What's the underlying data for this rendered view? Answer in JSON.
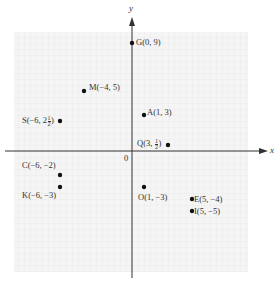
{
  "diagram": {
    "type": "coordinate-plane",
    "axes": {
      "x_label": "x",
      "y_label": "y",
      "origin_label": "0"
    },
    "grid": {
      "on": true,
      "x_range": [
        -10,
        10
      ],
      "y_range": [
        -10,
        10
      ],
      "unit_px": 12
    },
    "points": [
      {
        "id": "G",
        "x": 0,
        "y": 9,
        "label": "G(0, 9)",
        "label_side": "right"
      },
      {
        "id": "M",
        "x": -4,
        "y": 5,
        "label": "M(−4, 5)",
        "label_side": "right"
      },
      {
        "id": "A",
        "x": 1,
        "y": 3,
        "label": "A(1, 3)",
        "label_side": "right"
      },
      {
        "id": "S",
        "x": -6,
        "y": 2.5,
        "label_prefix": "S(−6, 2",
        "label_frac_num": "1",
        "label_frac_den": "2",
        "label_suffix": ")",
        "label_side": "left"
      },
      {
        "id": "Q",
        "x": 3,
        "y": 0.5,
        "label_prefix": "Q(3, ",
        "label_frac_num": "1",
        "label_frac_den": "2",
        "label_suffix": ")",
        "label_side": "left"
      },
      {
        "id": "C",
        "x": -6,
        "y": -2,
        "label": "C(−6, −2)",
        "label_side": "left"
      },
      {
        "id": "K",
        "x": -6,
        "y": -3,
        "label": "K(−6, −3)",
        "label_side": "left"
      },
      {
        "id": "O",
        "x": 1,
        "y": -3,
        "label": "O(1, −3)",
        "label_side": "below"
      },
      {
        "id": "E",
        "x": 5,
        "y": -4,
        "label": "E(5, −4)",
        "label_side": "right"
      },
      {
        "id": "I",
        "x": 5,
        "y": -5,
        "label": "I(5, −5)",
        "label_side": "right"
      }
    ],
    "colors": {
      "grid": "#e6e6e6",
      "grid_bg": "#f4f4f4",
      "axis": "#333333",
      "point": "#111111"
    }
  }
}
